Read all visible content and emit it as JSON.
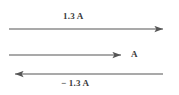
{
  "figure": {
    "background_color": "#ffffff",
    "stroke_color": "#555555",
    "text_color": "#3b3b3b",
    "width": 179,
    "height": 95
  },
  "vectors": [
    {
      "id": "top",
      "label": "1.3 A",
      "direction": "right",
      "label_position": "above-center",
      "x_start": 9,
      "x_end": 170,
      "y": 29,
      "length": 161
    },
    {
      "id": "middle",
      "label": "A",
      "direction": "right",
      "label_position": "right-of-tip",
      "x_start": 9,
      "x_end": 128,
      "y": 55,
      "length": 119
    },
    {
      "id": "bottom",
      "label": "− 1.3 A",
      "direction": "left",
      "label_position": "below-center",
      "x_start": 163,
      "x_end": 8,
      "y": 74,
      "length": 155
    }
  ]
}
